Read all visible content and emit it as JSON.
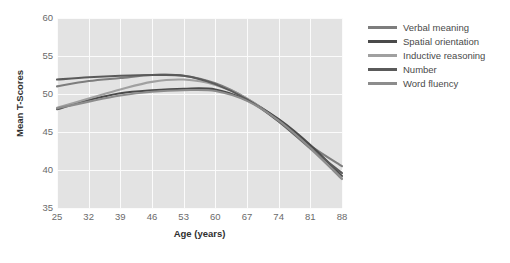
{
  "chart_data": {
    "type": "line",
    "title": "",
    "xlabel": "Age (years)",
    "ylabel": "Mean T-Scores",
    "xlim": [
      25,
      88
    ],
    "ylim": [
      35,
      60
    ],
    "xticks": [
      25,
      32,
      39,
      46,
      53,
      60,
      67,
      74,
      81,
      88
    ],
    "yticks": [
      35,
      40,
      45,
      50,
      55,
      60
    ],
    "grid": true,
    "legend_position": "right",
    "plot_background": "#e3e3e3",
    "gridline_color": "#fbfbfb",
    "x": [
      25,
      32,
      39,
      46,
      53,
      60,
      67,
      74,
      81,
      88
    ],
    "series": [
      {
        "name": "Verbal meaning",
        "color": "#7d7d7d",
        "values": [
          51.0,
          51.7,
          52.1,
          52.5,
          52.4,
          51.4,
          49.4,
          46.6,
          43.2,
          40.5
        ]
      },
      {
        "name": "Spatial orientation",
        "color": "#4a4a4a",
        "values": [
          48.0,
          49.2,
          50.1,
          50.5,
          50.7,
          50.6,
          49.2,
          46.7,
          43.3,
          39.2
        ]
      },
      {
        "name": "Inductive reasoning",
        "color": "#a0a0a0",
        "values": [
          48.2,
          49.4,
          50.6,
          51.6,
          51.9,
          51.2,
          49.4,
          46.4,
          42.8,
          38.9
        ]
      },
      {
        "name": "Number",
        "color": "#5a5a5a",
        "values": [
          51.9,
          52.2,
          52.4,
          52.5,
          52.4,
          51.3,
          49.3,
          46.4,
          42.9,
          39.6
        ]
      },
      {
        "name": "Word fluency",
        "color": "#8c8c8c",
        "values": [
          48.1,
          49.0,
          49.8,
          50.3,
          50.5,
          50.4,
          49.1,
          46.5,
          42.9,
          38.8
        ]
      }
    ]
  }
}
